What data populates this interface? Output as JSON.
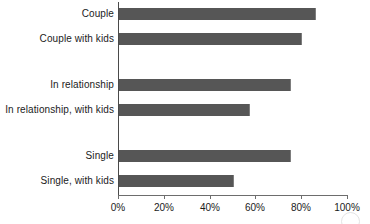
{
  "chart_data": {
    "type": "bar",
    "orientation": "horizontal",
    "title": "",
    "subtitle": "",
    "xlabel": "",
    "ylabel": "",
    "categories": [
      "Couple",
      "Couple with kids",
      "In relationship",
      "In relationship, with kids",
      "Single",
      "Single, with kids"
    ],
    "values": [
      86,
      80,
      75,
      57,
      75,
      50
    ],
    "value_suffix": "%",
    "xlim": [
      0,
      100
    ],
    "xticks": [
      0,
      20,
      40,
      60,
      80,
      100
    ],
    "xtick_labels": [
      "0%",
      "20%",
      "40%",
      "60%",
      "80%",
      "100%"
    ],
    "grid": false,
    "legend": null,
    "series": [
      {
        "name": "",
        "values": [
          86,
          80,
          75,
          57,
          75,
          50
        ]
      }
    ],
    "colors": {
      "bar": "#565656",
      "axis": "#6d6d6d",
      "text": "#1b1b1b",
      "background": "#ffffff"
    },
    "group_gaps_after": [
      1,
      3
    ]
  }
}
